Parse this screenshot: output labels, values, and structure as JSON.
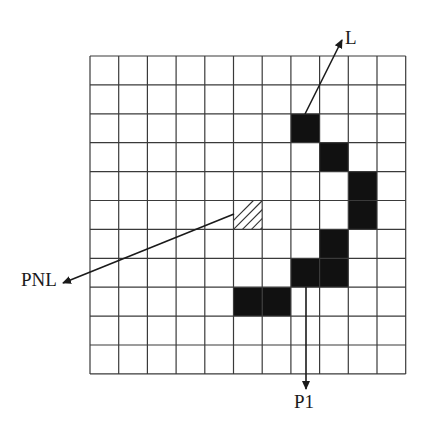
{
  "diagram": {
    "type": "pixel-grid",
    "grid": {
      "rows": 11,
      "cols": 11,
      "origin_x": 90,
      "origin_y": 56,
      "cell_w": 28.7,
      "cell_h": 28.9,
      "line_color": "#3a3a3a",
      "line_width": 1.2
    },
    "filled_cells": [
      {
        "row": 2,
        "col": 7
      },
      {
        "row": 3,
        "col": 8
      },
      {
        "row": 4,
        "col": 9
      },
      {
        "row": 5,
        "col": 9
      },
      {
        "row": 6,
        "col": 8
      },
      {
        "row": 7,
        "col": 7
      },
      {
        "row": 7,
        "col": 8
      },
      {
        "row": 8,
        "col": 5
      },
      {
        "row": 8,
        "col": 6
      }
    ],
    "filled_color": "#111111",
    "hatched_cells": [
      {
        "row": 5,
        "col": 5
      }
    ],
    "arrows": [
      {
        "name": "L",
        "from": [
          305,
          114
        ],
        "to": [
          342,
          40
        ]
      },
      {
        "name": "PNL",
        "from": [
          234,
          214
        ],
        "to": [
          63,
          283
        ]
      },
      {
        "name": "P1",
        "from": [
          306,
          287
        ],
        "to": [
          306,
          389
        ]
      }
    ],
    "labels": [
      {
        "id": "L",
        "text": "L",
        "x": 345,
        "y": 28
      },
      {
        "id": "PNL",
        "text": "PNL",
        "x": 21,
        "y": 270
      },
      {
        "id": "P1",
        "text": "P1",
        "x": 294,
        "y": 392
      }
    ]
  }
}
